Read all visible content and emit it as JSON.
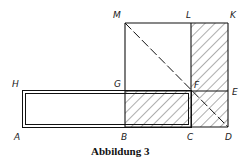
{
  "figure": {
    "caption": "Abbildung 3",
    "labels": {
      "M": "M",
      "L": "L",
      "K": "K",
      "H": "H",
      "G": "G",
      "F": "F",
      "E": "E",
      "A": "A",
      "B": "B",
      "C": "C",
      "D": "D"
    },
    "colors": {
      "line": "#111111",
      "hatch": "#333333",
      "background": "#ffffff"
    }
  }
}
